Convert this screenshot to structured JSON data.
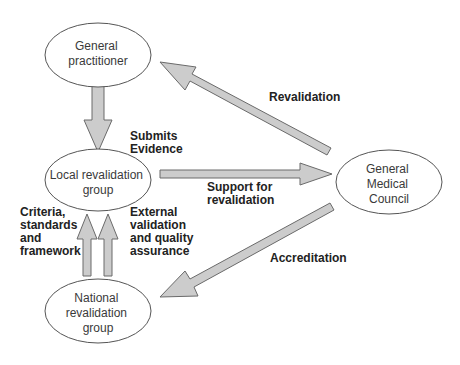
{
  "diagram": {
    "nodes": [
      {
        "id": "gp",
        "lines": [
          "General",
          "practitioner"
        ]
      },
      {
        "id": "local",
        "lines": [
          "Local revalidation",
          "group"
        ]
      },
      {
        "id": "national",
        "lines": [
          "National",
          "revalidation",
          "group"
        ]
      },
      {
        "id": "gmc",
        "lines": [
          "General",
          "Medical",
          "Council"
        ]
      }
    ],
    "edges": [
      {
        "from": "gp",
        "to": "local",
        "label_lines": [
          "Submits",
          "Evidence"
        ]
      },
      {
        "from": "local",
        "to": "gmc",
        "label_lines": [
          "Support for",
          "revalidation"
        ]
      },
      {
        "from": "gmc",
        "to": "gp",
        "label_lines": [
          "Revalidation"
        ]
      },
      {
        "from": "gmc",
        "to": "national",
        "label_lines": [
          "Accreditation"
        ]
      },
      {
        "from": "national",
        "to": "local",
        "label_lines": [
          "Criteria,",
          "standards",
          "and",
          "framework"
        ]
      },
      {
        "from": "national",
        "to": "local",
        "label_lines": [
          "External",
          "validation",
          "and quality",
          "assurance"
        ]
      }
    ]
  },
  "colors": {
    "arrow_fill": "#cccccc",
    "arrow_stroke": "#6a6a6a",
    "ellipse_stroke": "#555555",
    "node_text": "#3a3a3a",
    "label_text": "#222222"
  }
}
